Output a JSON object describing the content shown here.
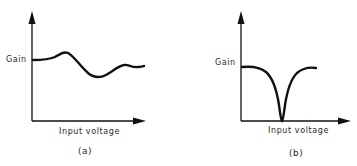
{
  "panels": [
    {
      "id": "a",
      "caption": "(a)",
      "ylabel": "Gain",
      "xlabel": "Input voltage",
      "description": "Gain varies with wavy ripple as input voltage increases"
    },
    {
      "id": "b",
      "caption": "(b)",
      "ylabel": "Gain",
      "xlabel": "Input voltage",
      "description": "Gain flat then sharp notch dropping to zero, recovering to flat"
    }
  ],
  "colors": {
    "line": "#111111",
    "text": "#2a2a2a",
    "background": "#ffffff"
  }
}
